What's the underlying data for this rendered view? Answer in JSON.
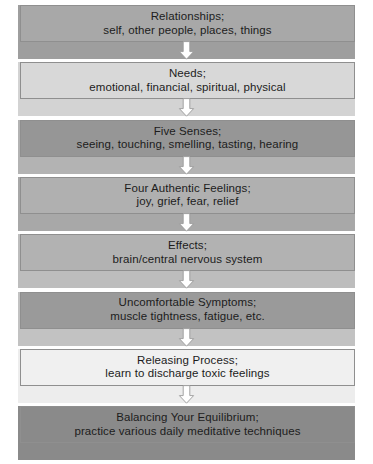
{
  "diagram": {
    "arrow_icon": "arrow-down-block-icon",
    "arrow_fill": "#ffffff",
    "arrow_stroke": "#9a9a9a",
    "text_color": "#1c1c1c",
    "box_border_color": "#8f8f8f",
    "background": "#ffffff",
    "stages": [
      {
        "id": "relationships",
        "line1": "Relationships;",
        "line2": "self, other people, places, things",
        "box_color": "#a8a8a8",
        "band_color": "#9e9e9e",
        "has_arrow": true
      },
      {
        "id": "needs",
        "line1": "Needs;",
        "line2": "emotional, financial, spiritual, physical",
        "box_color": "#d8d8d8",
        "band_color": "#d3d3d3",
        "has_arrow": true
      },
      {
        "id": "five-senses",
        "line1": "Five Senses;",
        "line2": "seeing, touching, smelling, tasting, hearing",
        "box_color": "#969696",
        "band_color": "#b3b3b3",
        "has_arrow": true
      },
      {
        "id": "four-authentic-feelings",
        "line1": "Four Authentic Feelings;",
        "line2": "joy, grief, fear, relief",
        "box_color": "#b0b0b0",
        "band_color": "#a8a8a8",
        "has_arrow": true
      },
      {
        "id": "effects",
        "line1": "Effects;",
        "line2": "brain/central nervous system",
        "box_color": "#b2b2b2",
        "band_color": "#bdbdbd",
        "has_arrow": true
      },
      {
        "id": "uncomfortable-symptoms",
        "line1": "Uncomfortable Symptoms;",
        "line2": "muscle tightness, fatigue, etc.",
        "box_color": "#9a9a9a",
        "band_color": "#c2c2c2",
        "has_arrow": true
      },
      {
        "id": "releasing-process",
        "line1": "Releasing Process;",
        "line2": "learn to discharge toxic feelings",
        "box_color": "#f0f0f0",
        "band_color": "#ededed",
        "has_arrow": true
      },
      {
        "id": "balancing-your-equilibrium",
        "line1": "Balancing Your Equilibrium;",
        "line2": "practice various daily meditative techniques",
        "box_color": "#8a8a8a",
        "band_color": "#8a8a8a",
        "has_arrow": false
      }
    ]
  }
}
